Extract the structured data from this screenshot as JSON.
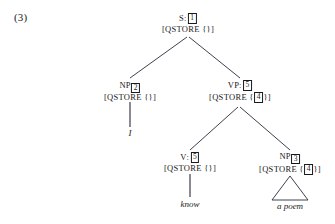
{
  "figure": {
    "example_number": "(3)",
    "sentence": "I know a poem",
    "nodes": {
      "s": {
        "category": "S",
        "colon": ":",
        "tag": "1",
        "feature_open": "[QSTORE {",
        "feature_contents": "",
        "feature_close": "}]"
      },
      "np_subject": {
        "category": "NP",
        "tag": "2",
        "feature_open": "[QSTORE {",
        "feature_contents": "",
        "feature_close": "}]",
        "word": "I"
      },
      "vp": {
        "category": "VP",
        "colon": ":",
        "tag": "5",
        "feature_open": "[QSTORE {",
        "feature_contents": "4",
        "feature_close": "}]"
      },
      "v": {
        "category": "V",
        "colon": ":",
        "tag": "5",
        "feature_open": "[QSTORE {",
        "feature_contents": "",
        "feature_close": "}]",
        "word": "know"
      },
      "np_object": {
        "category": "NP",
        "tag": "3",
        "feature_open": "[QSTORE {",
        "feature_contents": "4",
        "feature_close": "}]",
        "word": "a poem"
      }
    }
  }
}
